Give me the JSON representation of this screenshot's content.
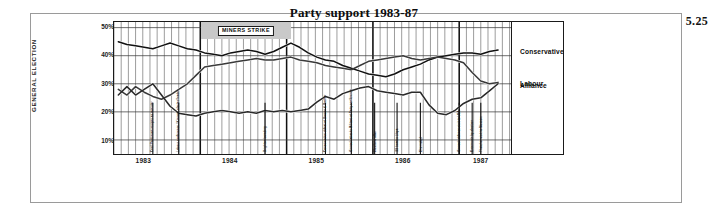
{
  "figure": {
    "number": "5.25"
  },
  "chart_data": {
    "type": "line",
    "title": "Party support 1983-87",
    "xlabel": "",
    "ylabel": "GENERAL ELECTION",
    "ylim": [
      5,
      52
    ],
    "yticks": [
      50,
      40,
      30,
      20,
      10
    ],
    "ytick_labels": [
      "50%",
      "40%",
      "30%",
      "20%",
      "10%"
    ],
    "xlim": [
      1983.0,
      1987.6
    ],
    "xtick_labels": [
      "1983",
      "1984",
      "1985",
      "1986",
      "1987"
    ],
    "xticks": [
      1983.35,
      1984.35,
      1985.35,
      1986.35,
      1987.25
    ],
    "grid": true,
    "legend_position": "right-inline",
    "series": [
      {
        "name": "Conservative",
        "color": "#111111",
        "x": [
          1983.05,
          1983.15,
          1983.25,
          1983.35,
          1983.45,
          1983.55,
          1983.65,
          1983.75,
          1983.85,
          1983.95,
          1984.05,
          1984.15,
          1984.25,
          1984.35,
          1984.45,
          1984.55,
          1984.65,
          1984.75,
          1984.85,
          1984.95,
          1985.05,
          1985.15,
          1985.25,
          1985.35,
          1985.45,
          1985.55,
          1985.65,
          1985.75,
          1985.85,
          1985.95,
          1986.05,
          1986.15,
          1986.25,
          1986.35,
          1986.45,
          1986.55,
          1986.65,
          1986.75,
          1986.85,
          1986.95,
          1987.05,
          1987.15,
          1987.25,
          1987.35,
          1987.45
        ],
        "values": [
          45,
          44,
          43.5,
          43,
          42.5,
          43.5,
          44.5,
          43.5,
          42.5,
          42,
          41,
          40.5,
          40,
          41,
          41.5,
          42,
          41.5,
          40.5,
          41.5,
          43,
          44.5,
          43,
          41,
          39.5,
          38.5,
          38,
          36.5,
          35.5,
          34.5,
          33.5,
          33,
          32.5,
          33.5,
          35,
          36,
          37,
          38.5,
          39.5,
          40,
          40.5,
          41,
          41,
          40.5,
          41.5,
          42
        ]
      },
      {
        "name": "Labour",
        "color": "#3a3a3a",
        "x": [
          1983.05,
          1983.15,
          1983.25,
          1983.35,
          1983.45,
          1983.55,
          1983.65,
          1983.75,
          1983.85,
          1983.95,
          1984.05,
          1984.15,
          1984.25,
          1984.35,
          1984.45,
          1984.55,
          1984.65,
          1984.75,
          1984.85,
          1984.95,
          1985.05,
          1985.15,
          1985.25,
          1985.35,
          1985.45,
          1985.55,
          1985.65,
          1985.75,
          1985.85,
          1985.95,
          1986.05,
          1986.15,
          1986.25,
          1986.35,
          1986.45,
          1986.55,
          1986.65,
          1986.75,
          1986.85,
          1986.95,
          1987.05,
          1987.15,
          1987.25,
          1987.35,
          1987.45
        ],
        "values": [
          28,
          26,
          29,
          27,
          25.5,
          24.5,
          26,
          28,
          30,
          33,
          36,
          36.5,
          37,
          37.5,
          38,
          38.5,
          39,
          38.5,
          38.5,
          39,
          39.5,
          38.5,
          38,
          37.5,
          36.5,
          36,
          35.5,
          35,
          36.5,
          38,
          38.5,
          39,
          39.5,
          40,
          39,
          38.5,
          39,
          39.5,
          39,
          38.5,
          37.5,
          34,
          31,
          30,
          30.5
        ]
      },
      {
        "name": "Alliance",
        "color": "#2a2a2a",
        "x": [
          1983.05,
          1983.15,
          1983.25,
          1983.35,
          1983.45,
          1983.55,
          1983.65,
          1983.75,
          1983.85,
          1983.95,
          1984.05,
          1984.15,
          1984.25,
          1984.35,
          1984.45,
          1984.55,
          1984.65,
          1984.75,
          1984.85,
          1984.95,
          1985.05,
          1985.15,
          1985.25,
          1985.35,
          1985.45,
          1985.55,
          1985.65,
          1985.75,
          1985.85,
          1985.95,
          1986.05,
          1986.15,
          1986.25,
          1986.35,
          1986.45,
          1986.55,
          1986.65,
          1986.75,
          1986.85,
          1986.95,
          1987.05,
          1987.15,
          1987.25,
          1987.35,
          1987.45
        ],
        "values": [
          26,
          29,
          26,
          28,
          30,
          26,
          22,
          19.5,
          19,
          18.5,
          19.5,
          20,
          20.5,
          20,
          19.5,
          20,
          19.5,
          20.5,
          20,
          20.5,
          20,
          20.5,
          21,
          23.5,
          25.5,
          24.5,
          26.5,
          27.5,
          28.5,
          29,
          27.5,
          27,
          26.5,
          26,
          27,
          27,
          22.5,
          19.5,
          19,
          20.5,
          23,
          24.5,
          25,
          27.5,
          30
        ]
      }
    ],
    "bands": [
      {
        "name": "miners-strike",
        "label": "MINERS STRIKE",
        "start": 1984.0,
        "end": 1985.05,
        "color": "#c9c9c9"
      }
    ],
    "events": [
      {
        "label": "Cecil Parkinson resigns as minister",
        "x": 1983.45
      },
      {
        "label": "Labour conference / Kinnock elected leader",
        "x": 1983.75
      },
      {
        "label": "Brighton bombing",
        "x": 1984.75
      },
      {
        "label": "Conservative defeat at Brecon & Radnor",
        "x": 1985.45
      },
      {
        "label": "Kinnock attacks Militant at Party conference",
        "x": 1985.75
      },
      {
        "label": "Westland affair",
        "x": 1986.02
      },
      {
        "label": "US bombs Libya",
        "x": 1986.28
      },
      {
        "label": "Chernobyl",
        "x": 1986.55
      },
      {
        "label": "Kinnock defence visit to USA",
        "x": 1987.0
      },
      {
        "label": "Greenwich by-election",
        "x": 1987.15
      },
      {
        "label": "Thatcher visit to Moscow",
        "x": 1987.25
      }
    ]
  }
}
